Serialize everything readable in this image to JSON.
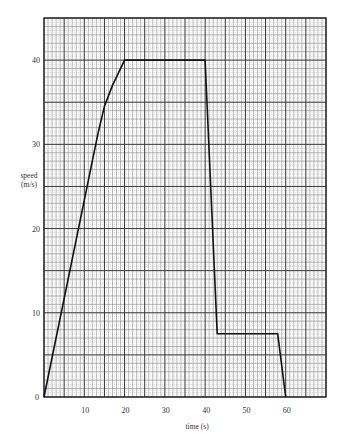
{
  "chart_data": {
    "type": "line",
    "title": "",
    "xlabel": "time (s)",
    "ylabel": "speed (m/s)",
    "ylabel_lines": [
      "speed",
      "(m/s)"
    ],
    "xlim": [
      0,
      70
    ],
    "ylim": [
      0,
      45
    ],
    "grid": true,
    "x_ticks": [
      0,
      10,
      20,
      30,
      40,
      50,
      60
    ],
    "x_tick_labels": [
      "10",
      "20",
      "30",
      "40",
      "50",
      "60"
    ],
    "y_ticks": [
      0,
      10,
      20,
      30,
      40
    ],
    "y_tick_labels": [
      "0",
      "10",
      "20",
      "30",
      "40"
    ],
    "series": [
      {
        "name": "speed-time",
        "x": [
          0,
          12,
          13.5,
          15,
          17,
          20,
          40,
          43,
          58,
          60
        ],
        "y": [
          0,
          28,
          31.5,
          34.5,
          37,
          40,
          40,
          7.5,
          7.5,
          0
        ]
      }
    ],
    "legend": null
  },
  "colors": {
    "line": "#111111",
    "grid_major": "#333333",
    "grid_minor": "#8a8a8a",
    "background": "#ffffff"
  }
}
